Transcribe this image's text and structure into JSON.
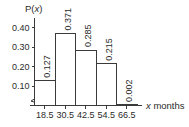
{
  "chart_data": {
    "type": "bar",
    "title": "",
    "subtitle": "",
    "ylabel": "P(x)",
    "xlabel": "x months",
    "xlabel_var": "x",
    "xlabel_rest": " months",
    "categories": [
      "18.5",
      "30.5",
      "42.5",
      "54.5",
      "66.5"
    ],
    "values": [
      0.127,
      0.371,
      0.285,
      0.215,
      0.002
    ],
    "value_labels": [
      "0.127",
      "0.371",
      "0.285",
      "0.215",
      "0.002"
    ],
    "ytick_labels": [
      "0.10",
      "0.20",
      "0.30",
      "0.40"
    ],
    "ytick_values": [
      0.1,
      0.2,
      0.3,
      0.4
    ],
    "xtick_labels": [
      "18.5",
      "30.5",
      "42.5",
      "54.5",
      "66.5"
    ],
    "ylim": [
      0,
      0.44
    ],
    "xlim": [
      12.5,
      72.5
    ],
    "bin_width": 12,
    "bin_edges": [
      12.5,
      24.5,
      36.5,
      48.5,
      60.5,
      72.5
    ],
    "grid": false,
    "legend": null,
    "axis_break": "y-axis zigzag break near origin",
    "bar_fill": "#ffffff",
    "bar_stroke": "#3a3a3a",
    "axis_color": "#3a3a3a",
    "text_color": "#2b2b2b",
    "background": "#ffffff",
    "value_label_rotation": -90
  }
}
